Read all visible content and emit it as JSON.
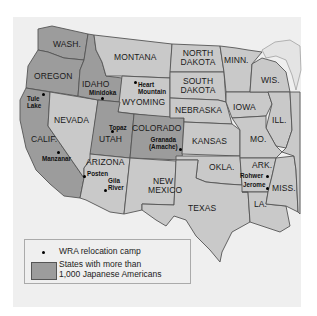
{
  "map": {
    "colors": {
      "background": "#efefef",
      "state_default": "#c9c9c9",
      "state_highlighted": "#9c9c9c",
      "border": "#555555",
      "camp_marker": "#000000"
    },
    "highlighted_states": [
      "WASH.",
      "OREGON",
      "CALIF.",
      "IDAHO",
      "UTAH",
      "COLORADO"
    ],
    "states": {
      "wash": "WASH.",
      "oregon": "OREGON",
      "calif": "CALIF.",
      "idaho": "IDAHO",
      "nevada": "NEVADA",
      "montana": "MONTANA",
      "wyoming": "WYOMING",
      "utah": "UTAH",
      "colorado": "COLORADO",
      "arizona": "ARIZONA",
      "new_mexico_1": "NEW",
      "new_mexico_2": "MEXICO",
      "north_dakota_1": "NORTH",
      "north_dakota_2": "DAKOTA",
      "south_dakota_1": "SOUTH",
      "south_dakota_2": "DAKOTA",
      "nebraska": "NEBRASKA",
      "kansas": "KANSAS",
      "okla": "OKLA.",
      "texas": "TEXAS",
      "minn": "MINN.",
      "iowa": "IOWA",
      "mo": "MO.",
      "ark": "ARK.",
      "la": "LA.",
      "wis": "WIS.",
      "ill": "ILL.",
      "miss": "MISS."
    },
    "camps": {
      "tule_lake_1": "Tule",
      "tule_lake_2": "Lake",
      "minidoka": "Minidoka",
      "heart_mountain_1": "Heart",
      "heart_mountain_2": "Mountain",
      "topaz": "Topaz",
      "granada_1": "Granada",
      "granada_2": "(Amache)",
      "manzanar": "Manzanar",
      "posten": "Posten",
      "gila_river_1": "Gila",
      "gila_river_2": "River",
      "rohwer": "Rohwer",
      "jerome": "Jerome"
    }
  },
  "legend": {
    "camp_label": "WRA relocation camp",
    "states_label_1": "States with more than",
    "states_label_2": "1,000 Japanese Americans"
  }
}
